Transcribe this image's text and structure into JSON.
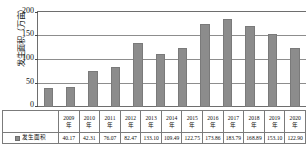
{
  "chart_data": {
    "type": "bar",
    "title": "",
    "xlabel": "",
    "ylabel": "发生面积（万亩）",
    "ylim": [
      0,
      200
    ],
    "yticks": [
      "0",
      "50",
      "100",
      "150",
      "200"
    ],
    "grid": true,
    "legend_position": "table-row-header",
    "categories": [
      "2009年",
      "2010年",
      "2011年",
      "2012年",
      "2013年",
      "2014年",
      "2015年",
      "2016年",
      "2017年",
      "2018年",
      "2019年",
      "2020年"
    ],
    "series": [
      {
        "name": "发生面积",
        "color": "#8c8c8c",
        "values": [
          40.17,
          42.31,
          76.07,
          82.47,
          133.1,
          109.49,
          122.75,
          173.86,
          183.79,
          168.89,
          153.1,
          122.9
        ]
      }
    ],
    "value_labels": [
      "40.17",
      "42.31",
      "76.07",
      "82.47",
      "133.10",
      "109.49",
      "122.75",
      "173.86",
      "183.79",
      "168.89",
      "153.10",
      "122.90"
    ]
  },
  "axis": {
    "y_label_text": "发生面积（万亩）",
    "y_tick_0": "0",
    "y_tick_1": "50",
    "y_tick_2": "100",
    "y_tick_3": "150",
    "y_tick_4": "200"
  },
  "legend": {
    "series_label": "发生面积",
    "swatch_color": "#8c8c8c"
  }
}
